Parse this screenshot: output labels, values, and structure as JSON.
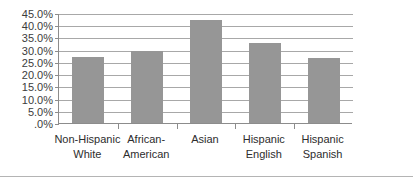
{
  "chart_data": {
    "type": "bar",
    "title": "",
    "subtitle": "",
    "xlabel": "",
    "ylabel": "",
    "categories": [
      "Non-Hispanic White",
      "African-American",
      "Asian",
      "Hispanic English",
      "Hispanic Spanish"
    ],
    "category_lines": [
      [
        "Non-Hispanic",
        "White"
      ],
      [
        "African-",
        "American"
      ],
      [
        "Asian",
        ""
      ],
      [
        "Hispanic",
        "English"
      ],
      [
        "Hispanic",
        "Spanish"
      ]
    ],
    "values": [
      27.0,
      29.5,
      42.3,
      32.8,
      26.5
    ],
    "value_labels": [
      "27.0%",
      "29.5%",
      "42.3%",
      "32.8%",
      "26.5%"
    ],
    "ylim": [
      0,
      45
    ],
    "ytick_step": 5,
    "ytick_labels": [
      "45.0%",
      "40.0%",
      "35.0%",
      "30.0%",
      "25.0%",
      "20.0%",
      "15.0%",
      "10.0%",
      "5.0%",
      ".0%"
    ],
    "ytick_values": [
      45,
      40,
      35,
      30,
      25,
      20,
      15,
      10,
      5,
      0
    ],
    "grid": true,
    "grid_axis": "y",
    "legend": false,
    "legend_position": "none",
    "series": [
      {
        "name": "",
        "values": [
          27.0,
          29.5,
          42.3,
          32.8,
          26.5
        ],
        "color": "#969696"
      }
    ],
    "colors": {
      "bar": "#969696",
      "gridline": "#a8a8a8",
      "axis": "#8c8c8c",
      "frame": "#b4b4b4",
      "text": "#2d2d2d",
      "plot_background": "#ffffff"
    }
  }
}
